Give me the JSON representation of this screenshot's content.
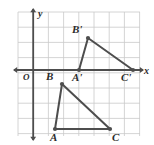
{
  "figure": {
    "background_color": "#ffffff",
    "grid": {
      "color": "#c9c9c9",
      "cell_size": 15.2,
      "columns": 8,
      "rows": 8,
      "left": 18,
      "top": 12,
      "right": 140,
      "bottom": 136,
      "show_grid": true
    },
    "axes": {
      "color": "#4d4d4d",
      "origin_x": 33.2,
      "origin_y": 70.0,
      "x_axis_label": "x",
      "y_axis_label": "y",
      "origin_label": "O",
      "x_axis_label_pos": {
        "x": 144,
        "y": 74
      },
      "y_axis_label_pos": {
        "x": 38,
        "y": 17
      },
      "origin_label_pos": {
        "x": 23,
        "y": 80
      }
    },
    "shapes": [
      {
        "name": "triangle-ABC",
        "stroke": "#4d4d4d",
        "vertices": [
          {
            "label": "A",
            "x": 55.0,
            "y": 129.0,
            "label_x": 50,
            "label_y": 141
          },
          {
            "label": "B",
            "x": 62.0,
            "y": 84.0,
            "label_x": 46,
            "label_y": 80
          },
          {
            "label": "C",
            "x": 110.0,
            "y": 129.0,
            "label_x": 112,
            "label_y": 141
          }
        ]
      },
      {
        "name": "triangle-A-prime-B-prime-C-prime",
        "stroke": "#4d4d4d",
        "vertices": [
          {
            "label": "A'",
            "x": 79.0,
            "y": 70.0,
            "label_x": 72,
            "label_y": 81
          },
          {
            "label": "B'",
            "x": 88.0,
            "y": 38.0,
            "label_x": 72,
            "label_y": 33
          },
          {
            "label": "C'",
            "x": 133.0,
            "y": 70.0,
            "label_x": 121,
            "label_y": 81
          }
        ]
      }
    ],
    "vertex_dot_color": "#4d4d4d",
    "vertex_dot_radius": 2.1
  }
}
